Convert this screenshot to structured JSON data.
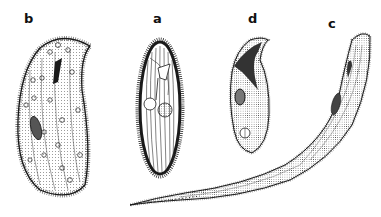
{
  "figure": {
    "labels": {
      "b": "b",
      "a": "a",
      "d": "d",
      "c": "c"
    },
    "colors": {
      "ink": "#1a1a1a",
      "background": "#ffffff"
    }
  }
}
